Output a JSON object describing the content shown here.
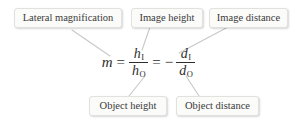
{
  "figure": {
    "background_color": "#ffffff",
    "text_color": "#3a3a38",
    "callout_fill": "#fbfbfa",
    "callout_border": "#e2e1dd",
    "connector_color": "#c9c8c4"
  },
  "callouts": {
    "lateral_magnification": "Lateral magnification",
    "image_height": "Image height",
    "image_distance": "Image distance",
    "object_height": "Object height",
    "object_distance": "Object distance"
  },
  "formula": {
    "full": "m = h_I / h_O = - d_I / d_O",
    "magnification_symbol": "m",
    "equals_1": "=",
    "equals_2": "=",
    "minus": "−",
    "image_height_symbol": "h",
    "image_height_subscript": "I",
    "object_height_symbol": "h",
    "object_height_subscript": "O",
    "image_distance_symbol": "d",
    "image_distance_subscript": "I",
    "object_distance_symbol": "d",
    "object_distance_subscript": "O"
  }
}
